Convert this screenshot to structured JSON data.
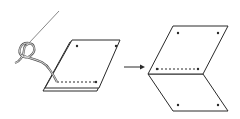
{
  "diagram": {
    "type": "instructional-illustration",
    "colors": {
      "line": "#2a2a2a",
      "thread": "#555555",
      "background": "#ffffff"
    },
    "steps": [
      {
        "label": "step-1-stitch",
        "elements": [
          "needle",
          "thread-loop",
          "stacked-fabric",
          "seam-line",
          "marker-dots"
        ]
      },
      {
        "label": "step-2-open",
        "elements": [
          "top-panel",
          "bottom-panel",
          "seam-line",
          "marker-dots"
        ]
      }
    ],
    "arrow": {
      "direction": "right"
    }
  }
}
